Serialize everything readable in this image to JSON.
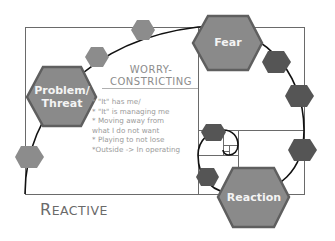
{
  "diagram": {
    "title": "REACTIVE",
    "title_first_letter": "R",
    "title_rest": "EACTIVE",
    "section_heading": {
      "line1": "WORRY-",
      "line2": "CONSTRICTING"
    },
    "bullets": [
      "* \"It\" has me/",
      "* \"It\" is managing me",
      "* Moving away from",
      "what I do not want",
      "* Playing to not lose",
      "*Outside -> In operating"
    ],
    "nodes": {
      "problem": {
        "line1": "Problem/",
        "line2": "Threat"
      },
      "fear": {
        "label": "Fear"
      },
      "reaction": {
        "label": "Reaction"
      }
    },
    "colors": {
      "major_hex_fill": "#8a8a8a",
      "major_hex_border": "#5f5f5f",
      "minor_hex_light": "#8c8c8c",
      "minor_hex_dark": "#555555",
      "lines": "#555555",
      "spiral": "#111111",
      "text_gray": "#9a9a9a"
    }
  }
}
